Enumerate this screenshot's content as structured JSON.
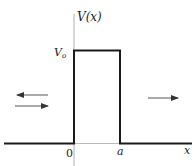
{
  "diagram": {
    "type": "rectangular potential barrier",
    "labels": {
      "y_axis": "V(x)",
      "barrier_height": "V",
      "barrier_height_sub": "o",
      "origin": "0",
      "barrier_end": "a",
      "x_axis": "x"
    },
    "arrows": [
      {
        "region": "left",
        "direction": "left",
        "meaning": "reflected wave"
      },
      {
        "region": "left",
        "direction": "right",
        "meaning": "incident wave"
      },
      {
        "region": "right",
        "direction": "right",
        "meaning": "transmitted wave"
      }
    ],
    "colors": {
      "line": "#1a1a1a",
      "axis": "#888888",
      "arrow": "#555555"
    }
  }
}
